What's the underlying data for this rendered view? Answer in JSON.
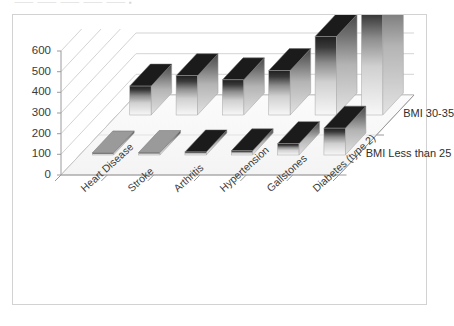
{
  "page": {
    "top_cropped_text": "⸻ ⸻ ⸻  ⸻ ⸻   ▪"
  },
  "chart_data": {
    "type": "bar",
    "title": "",
    "subtitle": "",
    "xlabel": "",
    "ylabel": "",
    "zlabel": "",
    "categories": [
      "Heart Disease",
      "Stroke",
      "Arthritis",
      "Hypertension",
      "Gallstones",
      "Diabetes (type 2)"
    ],
    "series": [
      {
        "name": "BMI Less than 25",
        "values": [
          10,
          12,
          15,
          20,
          55,
          130
        ]
      },
      {
        "name": "BMI 30-35",
        "values": [
          140,
          190,
          170,
          215,
          380,
          560
        ]
      }
    ],
    "ylim": [
      0,
      600
    ],
    "yticks": [
      0,
      100,
      200,
      300,
      400,
      500,
      600
    ],
    "ytick_labels": [
      "0",
      "100",
      "200",
      "300",
      "400",
      "500",
      "600"
    ],
    "grid": true,
    "legend": "depth-axis",
    "style": "3d-column-grayscale-gradient",
    "colors": {
      "bar_top": "#2b2b2b",
      "bar_bottom": "#f2f2f2",
      "bar_side": "#b8b8b8",
      "grid": "#c8c8c8",
      "axis": "#9a9a9a",
      "frame": "#d2d2d2",
      "text": "#3a3a3a",
      "background": "#ffffff"
    }
  }
}
